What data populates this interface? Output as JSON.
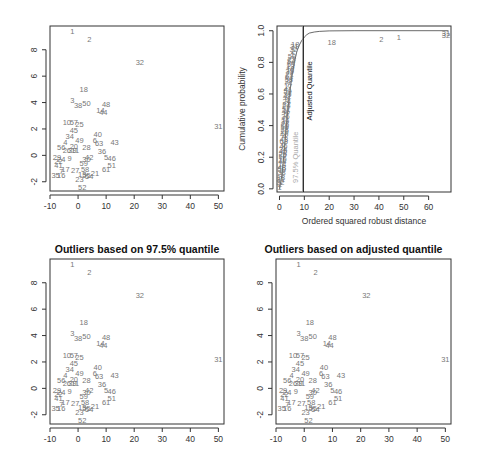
{
  "chart_data": [
    {
      "type": "scatter",
      "panel": "top-left",
      "title": "",
      "xlabel": "",
      "ylabel": "",
      "xlim": [
        -10,
        52
      ],
      "ylim": [
        -2.7,
        9.8
      ],
      "xticks": [
        -10,
        0,
        10,
        20,
        30,
        40,
        50
      ],
      "yticks": [
        -2,
        0,
        2,
        4,
        6,
        8
      ],
      "points": "shared"
    },
    {
      "type": "line",
      "panel": "top-right",
      "title": "",
      "xlabel": "Ordered squared robust distance",
      "ylabel": "Cumulative probability",
      "xlim": [
        -1,
        69
      ],
      "ylim": [
        -0.02,
        1.03
      ],
      "xticks": [
        0,
        10,
        20,
        30,
        40,
        50,
        60
      ],
      "yticks": [
        0.0,
        0.2,
        0.4,
        0.6,
        0.8,
        1.0
      ],
      "vlines": [
        {
          "x": 9.4,
          "label": "97.5% Quantile",
          "color": "#aaaaaa"
        },
        {
          "x": 9.6,
          "label": "Adjusted Quantile",
          "color": "#111111"
        }
      ],
      "curve": {
        "x": [
          0,
          1,
          2,
          3,
          4,
          5,
          6,
          7,
          8,
          9,
          10,
          11,
          12,
          14,
          16,
          20,
          30,
          68
        ],
        "y": [
          0.0,
          0.09,
          0.26,
          0.44,
          0.59,
          0.71,
          0.8,
          0.87,
          0.91,
          0.94,
          0.96,
          0.975,
          0.985,
          0.992,
          0.996,
          0.999,
          1.0,
          1.0
        ]
      },
      "labeled_points": [
        {
          "label": "18",
          "x": 21,
          "y": 0.93
        },
        {
          "label": "2",
          "x": 41,
          "y": 0.945
        },
        {
          "label": "1",
          "x": 48,
          "y": 0.96
        },
        {
          "label": "31",
          "x": 67,
          "y": 0.985
        },
        {
          "label": "32",
          "x": 67,
          "y": 0.97
        }
      ]
    },
    {
      "type": "scatter",
      "panel": "bottom-left",
      "title": "Outliers based on 97.5% quantile",
      "xlabel": "",
      "ylabel": "",
      "xlim": [
        -10,
        52
      ],
      "ylim": [
        -2.7,
        9.8
      ],
      "xticks": [
        -10,
        0,
        10,
        20,
        30,
        40,
        50
      ],
      "yticks": [
        -2,
        0,
        2,
        4,
        6,
        8
      ],
      "points": "shared"
    },
    {
      "type": "scatter",
      "panel": "bottom-right",
      "title": "Outliers based on adjusted quantile",
      "xlabel": "",
      "ylabel": "",
      "xlim": [
        -10,
        52
      ],
      "ylim": [
        -2.7,
        9.8
      ],
      "xticks": [
        -10,
        0,
        10,
        20,
        30,
        40,
        50
      ],
      "yticks": [
        -2,
        0,
        2,
        4,
        6,
        8
      ],
      "points": "shared"
    }
  ],
  "scatter_points": [
    {
      "label": "1",
      "x": -2,
      "y": 9.4
    },
    {
      "label": "2",
      "x": 4,
      "y": 8.8
    },
    {
      "label": "32",
      "x": 22,
      "y": 7.1
    },
    {
      "label": "31",
      "x": 50,
      "y": 2.2
    },
    {
      "label": "18",
      "x": 2,
      "y": 5.0
    },
    {
      "label": "3",
      "x": -2,
      "y": 4.2
    },
    {
      "label": "38",
      "x": 0,
      "y": 3.8
    },
    {
      "label": "50",
      "x": 3,
      "y": 4.0
    },
    {
      "label": "48",
      "x": 10,
      "y": 3.9
    },
    {
      "label": "14",
      "x": 8,
      "y": 3.4
    },
    {
      "label": "44",
      "x": 9,
      "y": 3.3
    },
    {
      "label": "10",
      "x": -4,
      "y": 2.5
    },
    {
      "label": "57",
      "x": -1.5,
      "y": 2.5
    },
    {
      "label": "25",
      "x": 0.5,
      "y": 2.4
    },
    {
      "label": "45",
      "x": -1.5,
      "y": 1.9
    },
    {
      "label": "34",
      "x": -3,
      "y": 1.5
    },
    {
      "label": "40",
      "x": 7,
      "y": 1.6
    },
    {
      "label": "6",
      "x": 6,
      "y": 1.2
    },
    {
      "label": "63",
      "x": 7.5,
      "y": 0.9
    },
    {
      "label": "43",
      "x": 13,
      "y": 1.0
    },
    {
      "label": "4",
      "x": -4.5,
      "y": 1.0
    },
    {
      "label": "49",
      "x": 0.5,
      "y": 1.2
    },
    {
      "label": "20",
      "x": -1.5,
      "y": 0.7
    },
    {
      "label": "28",
      "x": 3,
      "y": 0.6
    },
    {
      "label": "56",
      "x": -6,
      "y": 0.6
    },
    {
      "label": "26",
      "x": -4,
      "y": 0.4
    },
    {
      "label": "39",
      "x": -2,
      "y": 0.4
    },
    {
      "label": "11",
      "x": -1,
      "y": 0.4
    },
    {
      "label": "36",
      "x": 8.5,
      "y": 0.3
    },
    {
      "label": "5",
      "x": 10,
      "y": -0.1
    },
    {
      "label": "46",
      "x": 12,
      "y": -0.2
    },
    {
      "label": "51",
      "x": 12,
      "y": -0.7
    },
    {
      "label": "29",
      "x": -7.5,
      "y": -0.1
    },
    {
      "label": "22",
      "x": -7,
      "y": -0.4
    },
    {
      "label": "24",
      "x": -6,
      "y": -0.3
    },
    {
      "label": "9",
      "x": -3,
      "y": -0.2
    },
    {
      "label": "42",
      "x": 4,
      "y": -0.1
    },
    {
      "label": "30",
      "x": 3,
      "y": -0.3
    },
    {
      "label": "59",
      "x": 2,
      "y": -0.6
    },
    {
      "label": "41",
      "x": -7,
      "y": -0.7
    },
    {
      "label": "17",
      "x": -4.5,
      "y": -1.0
    },
    {
      "label": "7",
      "x": -6,
      "y": -1.2
    },
    {
      "label": "27",
      "x": -1,
      "y": -1.1
    },
    {
      "label": "58",
      "x": 2.5,
      "y": -1.0
    },
    {
      "label": "61",
      "x": 10,
      "y": -1.0
    },
    {
      "label": "21",
      "x": 6,
      "y": -1.3
    },
    {
      "label": "35",
      "x": -8,
      "y": -1.5
    },
    {
      "label": "16",
      "x": -6,
      "y": -1.5
    },
    {
      "label": "13",
      "x": 1.5,
      "y": -1.4
    },
    {
      "label": "55",
      "x": 3,
      "y": -1.5
    },
    {
      "label": "54",
      "x": 4,
      "y": -1.6
    },
    {
      "label": "23",
      "x": 0.5,
      "y": -1.8
    },
    {
      "label": "52",
      "x": 1.5,
      "y": -2.4
    }
  ]
}
